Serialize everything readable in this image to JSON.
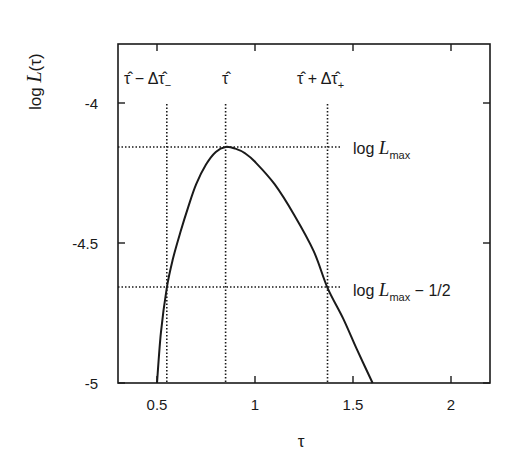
{
  "chart_data": {
    "type": "line",
    "title": "",
    "xlabel": "τ",
    "ylabel": "log L(τ)",
    "xlim": [
      0.3,
      2.2
    ],
    "ylim": [
      -5.0,
      -3.79
    ],
    "xticks": [
      0.5,
      1,
      1.5,
      2
    ],
    "xtick_labels": [
      "0.5",
      "1",
      "1.5",
      "2"
    ],
    "yticks": [
      -4,
      -4.5,
      -5
    ],
    "ytick_labels": [
      "-4",
      "-4.5",
      "-5"
    ],
    "grid": false,
    "legend": null,
    "series": [
      {
        "name": "log L(τ)",
        "style": "solid",
        "x": [
          0.5,
          0.52,
          0.55,
          0.58,
          0.62,
          0.66,
          0.7,
          0.75,
          0.8,
          0.85,
          0.9,
          0.95,
          1.0,
          1.1,
          1.2,
          1.3,
          1.37,
          1.45,
          1.52,
          1.6
        ],
        "y": [
          -5.0,
          -4.82,
          -4.66,
          -4.56,
          -4.46,
          -4.37,
          -4.29,
          -4.22,
          -4.175,
          -4.157,
          -4.163,
          -4.18,
          -4.21,
          -4.29,
          -4.4,
          -4.53,
          -4.66,
          -4.77,
          -4.88,
          -5.0
        ]
      }
    ],
    "reference_lines": {
      "horizontal": [
        {
          "y": -4.157,
          "label": "log L_max"
        },
        {
          "y": -4.657,
          "label": "log L_max − 1/2"
        }
      ],
      "vertical": [
        {
          "x": 0.55,
          "label": "τ̂ − Δτ̂₋"
        },
        {
          "x": 0.85,
          "label": "τ̂"
        },
        {
          "x": 1.37,
          "label": "τ̂ + Δτ̂₊"
        }
      ],
      "style": "dotted"
    },
    "annotations": [
      {
        "text": "τ̂ − Δτ̂₋",
        "x": 0.55,
        "position": "top"
      },
      {
        "text": "τ̂",
        "x": 0.85,
        "position": "top"
      },
      {
        "text": "τ̂ + Δτ̂₊",
        "x": 1.37,
        "position": "top"
      },
      {
        "text": "log L_max",
        "y": -4.157,
        "position": "right"
      },
      {
        "text": "log L_max − 1/2",
        "y": -4.657,
        "position": "right"
      }
    ]
  },
  "labels": {
    "ylabel_prefix": "log ",
    "ylabel_L": "L",
    "ylabel_suffix": "(τ)",
    "xlabel": "τ",
    "ann_tau_minus_main": "τ̂ − Δτ̂",
    "ann_tau_minus_sub": "−",
    "ann_tau_hat": "τ̂",
    "ann_tau_plus_main": "τ̂ + Δτ̂",
    "ann_tau_plus_sub": "+",
    "ann_lmax_log": "log ",
    "ann_lmax_L": "L",
    "ann_lmax_sub": "max",
    "ann_lhalf_log": "log ",
    "ann_lhalf_L": "L",
    "ann_lhalf_sub": "max",
    "ann_lhalf_tail": " − 1/2"
  }
}
